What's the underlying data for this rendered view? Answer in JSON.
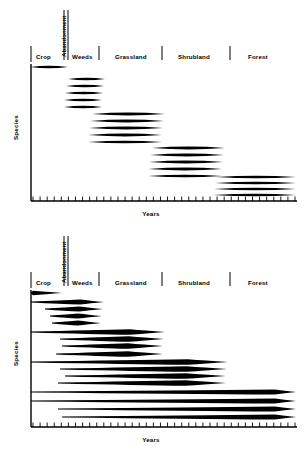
{
  "figure": {
    "panels": [
      {
        "id": "top",
        "model_name": "relay-floristics",
        "axis": {
          "ylabel": "Species",
          "xlabel": "Years"
        },
        "stages": [
          {
            "key": "crop",
            "label": "Crop"
          },
          {
            "key": "abandonment",
            "label": "Abandonment",
            "orientation": "vertical"
          },
          {
            "key": "weeds",
            "label": "Weeds"
          },
          {
            "key": "grassland",
            "label": "Grassland"
          },
          {
            "key": "shrubland",
            "label": "Shrubland"
          },
          {
            "key": "forest",
            "label": "Forest"
          }
        ]
      },
      {
        "id": "bottom",
        "model_name": "initial-floristic-composition",
        "axis": {
          "ylabel": "Species",
          "xlabel": "Years"
        },
        "stages": [
          {
            "key": "crop",
            "label": "Crop"
          },
          {
            "key": "abandonment",
            "label": "Abandonment",
            "orientation": "vertical"
          },
          {
            "key": "weeds",
            "label": "Weeds"
          },
          {
            "key": "grassland",
            "label": "Grassland"
          },
          {
            "key": "shrubland",
            "label": "Shrubland"
          },
          {
            "key": "forest",
            "label": "Forest"
          }
        ]
      }
    ]
  },
  "chart_data": [
    {
      "type": "area",
      "id": "top-panel",
      "title": "Relay floristics",
      "xlabel": "Years",
      "ylabel": "Species",
      "xlim": [
        0,
        100
      ],
      "ylim": [
        0,
        100
      ],
      "grid": false,
      "legend": false,
      "axis_ticks": {
        "x_tick_count": 38,
        "x_tick_labels": [],
        "y_tick_labels": []
      },
      "stage_boundaries_px": [
        31,
        64,
        68,
        99,
        162,
        230,
        295
      ],
      "stage_labels": [
        "Crop",
        "Abandonment",
        "Weeds",
        "Grassland",
        "Shrubland",
        "Forest"
      ],
      "note": "Each seral stage carries its own discrete cohort of species lenses; cohorts do not overlap in time, producing a descending staircase.",
      "series": [
        {
          "name": "crop-1",
          "stage": "Crop",
          "x_start": 30,
          "x_end": 68,
          "y": 67,
          "peak_thickness": 2.4
        },
        {
          "name": "weeds-1",
          "stage": "Weeds",
          "x_start": 68,
          "x_end": 105,
          "y": 79,
          "peak_thickness": 2.6
        },
        {
          "name": "weeds-2",
          "stage": "Weeds",
          "x_start": 66,
          "x_end": 104,
          "y": 86,
          "peak_thickness": 2.6
        },
        {
          "name": "weeds-3",
          "stage": "Weeds",
          "x_start": 65,
          "x_end": 103,
          "y": 93,
          "peak_thickness": 2.6
        },
        {
          "name": "weeds-4",
          "stage": "Weeds",
          "x_start": 64,
          "x_end": 102,
          "y": 100,
          "peak_thickness": 2.6
        },
        {
          "name": "weeds-5",
          "stage": "Weeds",
          "x_start": 64,
          "x_end": 102,
          "y": 107,
          "peak_thickness": 2.4
        },
        {
          "name": "grass-1",
          "stage": "Grassland",
          "x_start": 92,
          "x_end": 165,
          "y": 114,
          "peak_thickness": 2.8
        },
        {
          "name": "grass-2",
          "stage": "Grassland",
          "x_start": 90,
          "x_end": 164,
          "y": 121,
          "peak_thickness": 2.8
        },
        {
          "name": "grass-3",
          "stage": "Grassland",
          "x_start": 89,
          "x_end": 163,
          "y": 128,
          "peak_thickness": 2.8
        },
        {
          "name": "grass-4",
          "stage": "Grassland",
          "x_start": 88,
          "x_end": 162,
          "y": 135,
          "peak_thickness": 2.8
        },
        {
          "name": "grass-5",
          "stage": "Grassland",
          "x_start": 88,
          "x_end": 162,
          "y": 142,
          "peak_thickness": 2.6
        },
        {
          "name": "shrub-1",
          "stage": "Shrubland",
          "x_start": 152,
          "x_end": 225,
          "y": 148,
          "peak_thickness": 2.8
        },
        {
          "name": "shrub-2",
          "stage": "Shrubland",
          "x_start": 150,
          "x_end": 224,
          "y": 155,
          "peak_thickness": 2.8
        },
        {
          "name": "shrub-3",
          "stage": "Shrubland",
          "x_start": 149,
          "x_end": 223,
          "y": 162,
          "peak_thickness": 2.8
        },
        {
          "name": "shrub-4",
          "stage": "Shrubland",
          "x_start": 148,
          "x_end": 222,
          "y": 169,
          "peak_thickness": 2.8
        },
        {
          "name": "shrub-5",
          "stage": "Shrubland",
          "x_start": 148,
          "x_end": 222,
          "y": 176,
          "peak_thickness": 2.6
        },
        {
          "name": "forest-1",
          "stage": "Forest",
          "x_start": 216,
          "x_end": 296,
          "y": 177,
          "peak_thickness": 2.6
        },
        {
          "name": "forest-2",
          "stage": "Forest",
          "x_start": 215,
          "x_end": 296,
          "y": 183,
          "peak_thickness": 2.6
        },
        {
          "name": "forest-3",
          "stage": "Forest",
          "x_start": 214,
          "x_end": 296,
          "y": 189,
          "peak_thickness": 2.6
        },
        {
          "name": "forest-4",
          "stage": "Forest",
          "x_start": 213,
          "x_end": 296,
          "y": 195,
          "peak_thickness": 2.6
        }
      ]
    },
    {
      "type": "area",
      "id": "bottom-panel",
      "title": "Initial floristic composition",
      "xlabel": "Years",
      "ylabel": "Species",
      "xlim": [
        0,
        100
      ],
      "ylim": [
        0,
        100
      ],
      "grid": false,
      "legend": false,
      "axis_ticks": {
        "x_tick_count": 38,
        "x_tick_labels": [],
        "y_tick_labels": []
      },
      "stage_boundaries_px": [
        31,
        64,
        68,
        99,
        162,
        230,
        295
      ],
      "stage_labels": [
        "Crop",
        "Abandonment",
        "Weeds",
        "Grassland",
        "Shrubland",
        "Forest"
      ],
      "note": "All species are present from the outset at the left axis; each reaches peak abundance during a different seral stage, so lines run from the axis and swell later.",
      "series": [
        {
          "name": "crop-1",
          "stage": "Crop",
          "x_start": 31,
          "x_end": 62,
          "peak_x": 33,
          "y": 67,
          "peak_thickness": 2.2
        },
        {
          "name": "weeds-1",
          "stage": "Weeds",
          "x_start": 31,
          "x_end": 104,
          "peak_x": 80,
          "y": 76,
          "peak_thickness": 2.6
        },
        {
          "name": "weeds-2",
          "stage": "Weeds",
          "x_start": 45,
          "x_end": 103,
          "peak_x": 79,
          "y": 83,
          "peak_thickness": 2.6
        },
        {
          "name": "weeds-3",
          "stage": "Weeds",
          "x_start": 50,
          "x_end": 102,
          "peak_x": 78,
          "y": 90,
          "peak_thickness": 2.6
        },
        {
          "name": "weeds-4",
          "stage": "Weeds",
          "x_start": 52,
          "x_end": 101,
          "peak_x": 78,
          "y": 97,
          "peak_thickness": 2.6
        },
        {
          "name": "grass-1",
          "stage": "Grassland",
          "x_start": 31,
          "x_end": 165,
          "peak_x": 130,
          "y": 106,
          "peak_thickness": 2.8
        },
        {
          "name": "grass-2",
          "stage": "Grassland",
          "x_start": 60,
          "x_end": 164,
          "peak_x": 129,
          "y": 113,
          "peak_thickness": 2.8
        },
        {
          "name": "grass-3",
          "stage": "Grassland",
          "x_start": 62,
          "x_end": 163,
          "peak_x": 128,
          "y": 120,
          "peak_thickness": 2.8
        },
        {
          "name": "grass-4",
          "stage": "Grassland",
          "x_start": 56,
          "x_end": 163,
          "peak_x": 128,
          "y": 128,
          "peak_thickness": 2.8
        },
        {
          "name": "shrub-1",
          "stage": "Shrubland",
          "x_start": 31,
          "x_end": 228,
          "peak_x": 188,
          "y": 136,
          "peak_thickness": 2.8
        },
        {
          "name": "shrub-2",
          "stage": "Shrubland",
          "x_start": 60,
          "x_end": 227,
          "peak_x": 187,
          "y": 143,
          "peak_thickness": 2.8
        },
        {
          "name": "shrub-3",
          "stage": "Shrubland",
          "x_start": 65,
          "x_end": 226,
          "peak_x": 186,
          "y": 150,
          "peak_thickness": 2.8
        },
        {
          "name": "shrub-4",
          "stage": "Shrubland",
          "x_start": 58,
          "x_end": 226,
          "peak_x": 186,
          "y": 157,
          "peak_thickness": 2.8
        },
        {
          "name": "forest-1",
          "stage": "Forest",
          "x_start": 31,
          "x_end": 296,
          "peak_x": 275,
          "y": 166,
          "peak_thickness": 2.6
        },
        {
          "name": "forest-2",
          "stage": "Forest",
          "x_start": 31,
          "x_end": 296,
          "peak_x": 275,
          "y": 175,
          "peak_thickness": 2.6
        },
        {
          "name": "forest-3",
          "stage": "Forest",
          "x_start": 58,
          "x_end": 296,
          "peak_x": 275,
          "y": 183,
          "peak_thickness": 2.6
        },
        {
          "name": "forest-4",
          "stage": "Forest",
          "x_start": 62,
          "x_end": 296,
          "peak_x": 275,
          "y": 191,
          "peak_thickness": 2.6
        }
      ]
    }
  ]
}
